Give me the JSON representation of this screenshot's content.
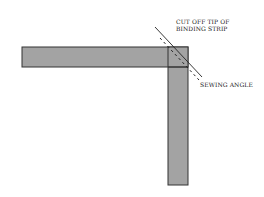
{
  "diagram": {
    "labels": {
      "cut_tip_line1": "CUT OFF TIP OF",
      "cut_tip_line2": "BINDING STRIP",
      "sewing_angle": "SEWING ANGLE"
    },
    "colors": {
      "strip_fill": "#a3a3a3",
      "strip_stroke": "#333333",
      "line": "#222222",
      "background": "#ffffff"
    },
    "shapes": {
      "horizontal_strip": {
        "x": 22,
        "y": 47,
        "width": 166,
        "height": 20
      },
      "vertical_strip": {
        "x": 168,
        "y": 47,
        "width": 20,
        "height": 138
      },
      "cut_line": {
        "x1": 155,
        "y1": 27,
        "x2": 202,
        "y2": 77
      },
      "sewing_line": {
        "x1": 160,
        "y1": 38,
        "x2": 199,
        "y2": 80
      }
    }
  }
}
